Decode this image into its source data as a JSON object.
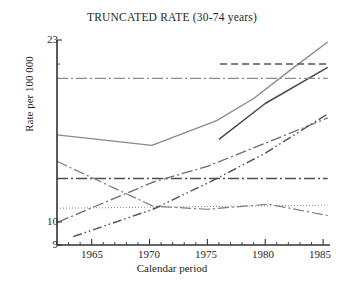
{
  "chart_data": {
    "type": "line",
    "title": "TRUNCATED RATE (30-74 years)",
    "xlabel": "Calendar period",
    "ylabel": "Rate per 100 000",
    "xlim": [
      1962,
      1985.6
    ],
    "ylim": [
      9,
      23
    ],
    "grid": false,
    "legend": "none",
    "y_scale": "log",
    "x_ticks": [
      1965,
      1970,
      1975,
      1980,
      1985
    ],
    "x_tick_labels": [
      "1965",
      "1970",
      "1975",
      "1980",
      "1985"
    ],
    "x_minor_tick_interval": 1,
    "y_ticks": [
      9,
      10,
      23
    ],
    "y_tick_labels": [
      "9",
      "10",
      "23"
    ],
    "series": [
      {
        "name": "solid-u-curve",
        "style": "solid",
        "color": "#8a8a8a",
        "width": 1.3,
        "x": [
          1962.0,
          1970.2,
          1975.8,
          1979.0,
          1982.0,
          1985.4
        ],
        "y": [
          14.9,
          14.2,
          15.9,
          17.6,
          19.9,
          22.8
        ]
      },
      {
        "name": "solid-rising-late",
        "style": "solid",
        "color": "#4a4a4a",
        "width": 1.5,
        "x": [
          1976.0,
          1980.0,
          1985.4
        ],
        "y": [
          14.6,
          17.2,
          20.3
        ]
      },
      {
        "name": "horizontal-dashdot-upper",
        "style": "dashdot",
        "color": "#8c8c8c",
        "width": 1.3,
        "x": [
          1962.0,
          1985.4
        ],
        "y": [
          19.3,
          19.3
        ]
      },
      {
        "name": "horizontal-dashed-upper-right",
        "style": "dashed",
        "color": "#555555",
        "width": 1.5,
        "x": [
          1976.1,
          1985.4
        ],
        "y": [
          20.6,
          20.6
        ]
      },
      {
        "name": "horizontal-dashdot-middle",
        "style": "dashdot",
        "color": "#4d4d4d",
        "width": 1.6,
        "x": [
          1962.0,
          1985.4
        ],
        "y": [
          12.2,
          12.2
        ]
      },
      {
        "name": "horizontal-dotted-lower",
        "style": "dotted",
        "color": "#8e8e8e",
        "width": 1.1,
        "x": [
          1962.0,
          1985.4
        ],
        "y": [
          10.65,
          10.8
        ]
      },
      {
        "name": "descending-dashdot",
        "style": "dashdot",
        "color": "#7b7b7b",
        "width": 1.2,
        "x": [
          1962.0,
          1970.3,
          1975.0,
          1980.3,
          1985.4
        ],
        "y": [
          13.2,
          10.75,
          10.6,
          10.85,
          10.3
        ]
      },
      {
        "name": "ascending-dashdot-upper",
        "style": "dashdot",
        "color": "#6b6b6b",
        "width": 1.3,
        "x": [
          1962.1,
          1970.3,
          1975.0,
          1980.2,
          1985.4
        ],
        "y": [
          10.0,
          12.0,
          12.9,
          14.4,
          16.1
        ]
      },
      {
        "name": "ascending-dashdotdot-lower",
        "style": "dashdotdot",
        "color": "#4f4f4f",
        "width": 1.4,
        "x": [
          1963.4,
          1970.3,
          1975.5,
          1980.0,
          1985.4
        ],
        "y": [
          9.35,
          10.6,
          12.1,
          13.7,
          16.4
        ]
      }
    ]
  },
  "axis": {
    "title": "TRUNCATED RATE (30-74 years)",
    "x_label": "Calendar period",
    "y_label": "Rate per 100 000",
    "y_top_label": "23",
    "y_mid_label": "10",
    "y_bottom_label": "9",
    "x_labels": [
      "1965",
      "1970",
      "1975",
      "1980",
      "1985"
    ]
  },
  "colors": {
    "axis": "#333333",
    "text": "#1f1f1f",
    "background": "#ffffff"
  }
}
